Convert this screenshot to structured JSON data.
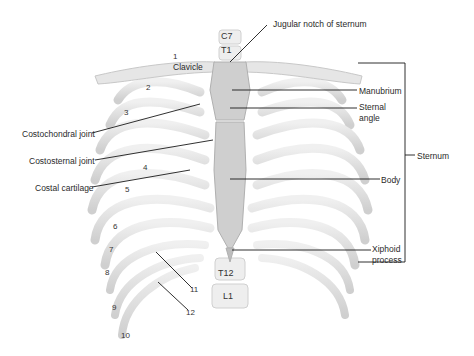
{
  "figure": {
    "colors": {
      "background": "#ffffff",
      "bone": "#e2e2e2",
      "bone_shade": "#c4c4c4",
      "cartilage": "#b4b4b4",
      "sternum": "#cfcfcf",
      "leader_line": "#1a1a1a",
      "text": "#2a2a2a"
    }
  },
  "vertebrae": {
    "c7": "C7",
    "t1": "T1",
    "t12": "T12",
    "l1": "L1"
  },
  "rib_numbers": [
    "1",
    "2",
    "3",
    "4",
    "5",
    "6",
    "7",
    "8",
    "9",
    "10",
    "11",
    "12"
  ],
  "labels_left": {
    "clavicle": "Clavicle",
    "costochondral_joint": "Costochondral joint",
    "costosternal_joint": "Costosternal joint",
    "costal_cartilage": "Costal cartilage"
  },
  "labels_right": {
    "jugular_notch": "Jugular notch of sternum",
    "manubrium": "Manubrium",
    "sternal_angle_1": "Sternal",
    "sternal_angle_2": "angle",
    "body": "Body",
    "xiphoid_1": "Xiphoid",
    "xiphoid_2": "process",
    "sternum": "Sternum"
  }
}
